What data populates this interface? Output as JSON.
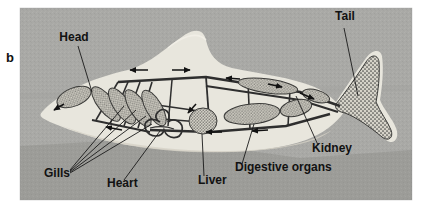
{
  "figure": {
    "panel_label": "b",
    "caption_labels": {
      "head": "Head",
      "tail": "Tail",
      "gills": "Gills",
      "heart": "Heart",
      "liver": "Liver",
      "digestive_organs": "Digestive organs",
      "kidney": "Kidney"
    }
  },
  "colors": {
    "page_background": "#ffffff",
    "panel_background": "#a9a9a6",
    "panel_background_lower": "#999996",
    "fish_body": "#e8e6dd",
    "fish_body_shadow": "#d6d3c8",
    "vessel_dark": "#2e2e2e",
    "organ_fill": "#cfccc2",
    "organ_stipple": "#4a4a4a",
    "label_text": "#121212",
    "leader_line": "#1a1a1a"
  },
  "panel": {
    "x": 20,
    "y": 8,
    "width": 392,
    "height": 192
  },
  "labels": [
    {
      "id": "head",
      "text": "Head",
      "x": 74,
      "y": 41,
      "anchor": "middle"
    },
    {
      "id": "tail",
      "text": "Tail",
      "x": 345,
      "y": 20,
      "anchor": "middle"
    },
    {
      "id": "gills",
      "text": "Gills",
      "x": 44,
      "y": 177,
      "anchor": "start"
    },
    {
      "id": "heart",
      "text": "Heart",
      "x": 107,
      "y": 187,
      "anchor": "start"
    },
    {
      "id": "liver",
      "text": "Liver",
      "x": 198,
      "y": 184,
      "anchor": "start"
    },
    {
      "id": "dig",
      "text": "Digestive organs",
      "x": 235,
      "y": 171,
      "anchor": "start"
    },
    {
      "id": "kidney",
      "text": "Kidney",
      "x": 312,
      "y": 152,
      "anchor": "start"
    }
  ],
  "organs": {
    "gill_arch_count": 4,
    "flow_arrow_count": 9
  }
}
